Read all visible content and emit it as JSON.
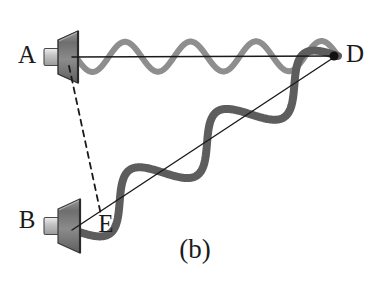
{
  "figure": {
    "caption": "(b)",
    "background_color": "#ffffff",
    "width": 385,
    "height": 282
  },
  "labels": [
    {
      "id": "A",
      "text": "A",
      "x": 27,
      "y": 57,
      "anchor": "middle",
      "name": "label-a"
    },
    {
      "id": "B",
      "text": "B",
      "x": 27,
      "y": 222,
      "anchor": "middle",
      "name": "label-b"
    },
    {
      "id": "D",
      "text": "D",
      "x": 346,
      "y": 56,
      "anchor": "start",
      "name": "label-d"
    },
    {
      "id": "E",
      "text": "E",
      "x": 106,
      "y": 226,
      "anchor": "middle",
      "name": "label-e"
    }
  ],
  "points": [
    {
      "id": "D",
      "x": 334,
      "y": 56,
      "radius": 4.5,
      "color": "#111111",
      "name": "point-d"
    }
  ],
  "speakers": [
    {
      "id": "A",
      "name": "speaker-a",
      "cone_tip_x": 58,
      "cone_tip_y": 57,
      "rim_x": 78,
      "rim_top_y": 31,
      "rim_bottom_y": 83,
      "magnet_x": 44,
      "magnet_w": 15,
      "magnet_h": 17,
      "body_color": "#7d7d7d",
      "edge_color": "#3a3a3a",
      "magnet_color": "#c8c8c8"
    },
    {
      "id": "B",
      "name": "speaker-b",
      "cone_tip_x": 58,
      "cone_tip_y": 226,
      "rim_x": 80,
      "rim_top_y": 199,
      "rim_bottom_y": 253,
      "magnet_x": 44,
      "magnet_w": 15,
      "magnet_h": 17,
      "body_color": "#7d7d7d",
      "edge_color": "#3a3a3a",
      "magnet_color": "#c8c8c8"
    }
  ],
  "rays": [
    {
      "id": "AD",
      "name": "ray-a-to-d",
      "from": "A",
      "to": "D",
      "x1": 72,
      "y1": 57,
      "x2": 336,
      "y2": 56,
      "color": "#1a1a1a",
      "width": 1.4,
      "dashed": false
    },
    {
      "id": "BD",
      "name": "ray-b-to-d",
      "from": "B",
      "to": "D",
      "x1": 72,
      "y1": 230,
      "x2": 336,
      "y2": 56,
      "color": "#1a1a1a",
      "width": 1.4,
      "dashed": false
    },
    {
      "id": "AE",
      "name": "ray-a-to-e-dashed",
      "from": "A",
      "to": "E",
      "x1": 69,
      "y1": 66,
      "x2": 101,
      "y2": 215,
      "color": "#1a1a1a",
      "width": 1.8,
      "dashed": true,
      "dash_pattern": "6 5"
    }
  ],
  "waves": [
    {
      "id": "wave-AD",
      "name": "wave-a-to-d",
      "along_ray": "AD",
      "x1": 76,
      "y1": 57,
      "x2": 338,
      "y2": 56,
      "cycles": 4.0,
      "amplitude": 15,
      "phase_deg": 0,
      "color": "#8e8e8e",
      "width": 6.0,
      "description": "light gray sinusoid of shorter wavelength travelling from speaker A to point D"
    },
    {
      "id": "wave-BD",
      "name": "wave-b-to-d",
      "along_ray": "BD",
      "x1": 76,
      "y1": 231,
      "x2": 338,
      "y2": 56,
      "cycles": 3.0,
      "amplitude": 21,
      "phase_deg": 0,
      "color": "#5d5d5d",
      "width": 8.0,
      "description": "dark gray sinusoid of longer wavelength travelling from speaker B through E to point D"
    }
  ],
  "colors": {
    "wave_upper": "#8e8e8e",
    "wave_lower": "#5d5d5d",
    "ray": "#1a1a1a",
    "text": "#1a1a1a",
    "speaker_body": "#7d7d7d",
    "background": "#ffffff"
  }
}
